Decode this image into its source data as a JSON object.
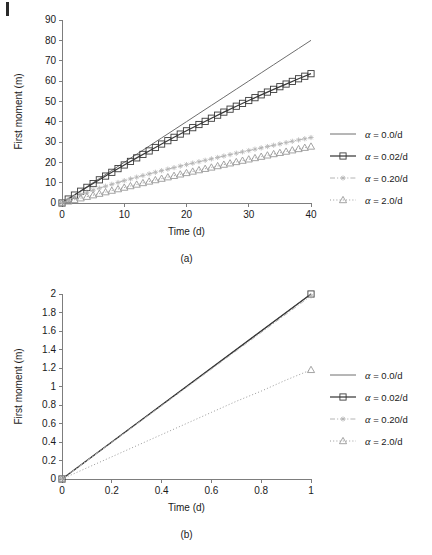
{
  "figure": {
    "panels": [
      {
        "caption": "(a)",
        "xlabel": "Time (d)",
        "ylabel": "First moment (m)"
      },
      {
        "caption": "(b)",
        "xlabel": "Time (d)",
        "ylabel": "First moment (m)"
      }
    ],
    "legend_symbol_alpha": "α",
    "legend_labels": [
      "α = 0.0/d",
      "α = 0.02/d",
      "α = 0.20/d",
      "α = 2.0/d"
    ]
  },
  "colors": {
    "axis": "#7d7d7d",
    "text": "#1a1a1a",
    "series_0": "#6e6e6e",
    "series_1": "#3a3a3a",
    "series_2": "#b4b4b4",
    "series_3": "#9a9a9a",
    "background": "#ffffff"
  },
  "chart_data": [
    {
      "type": "line",
      "panel": "(a)",
      "title": "",
      "xlabel": "Time (d)",
      "ylabel": "First moment (m)",
      "xlim": [
        0,
        40
      ],
      "ylim": [
        0,
        90
      ],
      "xticks": [
        0,
        10,
        20,
        30,
        40
      ],
      "yticks": [
        0,
        10,
        20,
        30,
        40,
        50,
        60,
        70,
        80,
        90
      ],
      "grid": false,
      "legend_position": "right",
      "series": [
        {
          "name": "α = 0.0/d",
          "style": "solid",
          "marker": "none",
          "color": "#6e6e6e",
          "x": [
            0,
            2,
            4,
            6,
            8,
            10,
            12,
            14,
            16,
            18,
            20,
            22,
            24,
            26,
            28,
            30,
            32,
            34,
            36,
            38,
            40
          ],
          "y": [
            0,
            4.0,
            8.0,
            12.0,
            16.0,
            20.0,
            24.0,
            28.0,
            32.0,
            36.0,
            40.0,
            44.0,
            48.0,
            52.0,
            56.0,
            60.0,
            64.0,
            68.0,
            72.0,
            76.0,
            80.0
          ]
        },
        {
          "name": "α = 0.02/d",
          "style": "solid",
          "marker": "square",
          "color": "#3a3a3a",
          "x": [
            0,
            2,
            4,
            6,
            8,
            10,
            12,
            14,
            16,
            18,
            20,
            22,
            24,
            26,
            28,
            30,
            32,
            34,
            36,
            38,
            40
          ],
          "y": [
            0,
            3.9,
            7.7,
            11.4,
            15.1,
            18.7,
            22.2,
            25.6,
            29.0,
            32.3,
            35.5,
            38.6,
            41.7,
            44.7,
            47.6,
            50.4,
            53.2,
            55.9,
            58.5,
            61.1,
            63.6
          ]
        },
        {
          "name": "α = 0.20/d",
          "style": "dashdot",
          "marker": "asterisk",
          "color": "#b4b4b4",
          "x": [
            0,
            2,
            4,
            6,
            8,
            10,
            12,
            14,
            16,
            18,
            20,
            22,
            24,
            26,
            28,
            30,
            32,
            34,
            36,
            38,
            40
          ],
          "y": [
            0,
            3.0,
            5.3,
            7.3,
            9.2,
            11.0,
            12.7,
            14.3,
            15.9,
            17.4,
            18.9,
            20.3,
            21.7,
            23.1,
            24.5,
            25.8,
            27.1,
            28.4,
            29.7,
            31.0,
            32.2
          ]
        },
        {
          "name": "α = 2.0/d",
          "style": "dotted",
          "marker": "triangle",
          "color": "#9a9a9a",
          "x": [
            0,
            2,
            4,
            6,
            8,
            10,
            12,
            14,
            16,
            18,
            20,
            22,
            24,
            26,
            28,
            30,
            32,
            34,
            36,
            38,
            40
          ],
          "y": [
            0,
            1.6,
            3.1,
            4.6,
            6.1,
            7.6,
            9.1,
            10.6,
            12.0,
            13.4,
            14.8,
            16.2,
            17.5,
            18.9,
            20.2,
            21.5,
            22.8,
            24.1,
            25.3,
            26.6,
            27.8
          ]
        }
      ]
    },
    {
      "type": "line",
      "panel": "(b)",
      "title": "",
      "xlabel": "Time (d)",
      "ylabel": "First moment (m)",
      "xlim": [
        0,
        1
      ],
      "ylim": [
        0,
        2
      ],
      "xticks": [
        0,
        0.2,
        0.4,
        0.6,
        0.8,
        1
      ],
      "yticks": [
        0,
        0.2,
        0.4,
        0.6,
        0.8,
        1,
        1.2,
        1.4,
        1.6,
        1.8,
        2
      ],
      "grid": false,
      "legend_position": "right",
      "series": [
        {
          "name": "α = 0.0/d",
          "style": "solid",
          "marker": "none",
          "color": "#6e6e6e",
          "x": [
            0,
            0.2,
            0.4,
            0.6,
            0.8,
            1
          ],
          "y": [
            0,
            0.4,
            0.8,
            1.2,
            1.6,
            2.0
          ]
        },
        {
          "name": "α = 0.02/d",
          "style": "solid",
          "marker": "square",
          "color": "#3a3a3a",
          "x": [
            0,
            1
          ],
          "y": [
            0,
            2.0
          ]
        },
        {
          "name": "α = 0.20/d",
          "style": "dashdot",
          "marker": "asterisk",
          "color": "#b4b4b4",
          "x": [
            0,
            1
          ],
          "y": [
            0,
            1.98
          ]
        },
        {
          "name": "α = 2.0/d",
          "style": "dotted",
          "marker": "triangle",
          "color": "#9a9a9a",
          "x": [
            0,
            0.1,
            0.2,
            0.3,
            0.4,
            0.5,
            0.6,
            0.7,
            0.8,
            0.9,
            1
          ],
          "y": [
            0,
            0.12,
            0.24,
            0.36,
            0.48,
            0.6,
            0.72,
            0.84,
            0.95,
            1.07,
            1.18
          ]
        }
      ]
    }
  ]
}
